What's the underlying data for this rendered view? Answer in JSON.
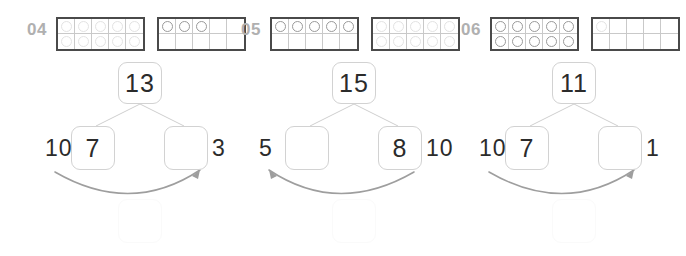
{
  "worksheet": {
    "type": "number-bond-ten-frame-worksheet",
    "problems": [
      {
        "number": "04",
        "frames": [
          {
            "filled": 10,
            "style": "faint"
          },
          {
            "filled": 3,
            "style": "solid"
          }
        ],
        "total": "13",
        "top_value": "13",
        "left_box_value": "7",
        "right_box_value": "",
        "outer_left_label": "10",
        "outer_right_label": "3",
        "arrow_direction": "right",
        "bottom_box_value": ""
      },
      {
        "number": "05",
        "frames": [
          {
            "filled": 5,
            "style": "solid"
          },
          {
            "filled": 10,
            "style": "faint"
          }
        ],
        "total": "15",
        "top_value": "15",
        "left_box_value": "",
        "right_box_value": "8",
        "outer_left_label": "5",
        "outer_right_label": "10",
        "arrow_direction": "left",
        "bottom_box_value": ""
      },
      {
        "number": "06",
        "frames": [
          {
            "filled": 10,
            "style": "solid"
          },
          {
            "filled": 1,
            "style": "faint"
          }
        ],
        "total": "11",
        "top_value": "11",
        "left_box_value": "7",
        "right_box_value": "",
        "outer_left_label": "10",
        "outer_right_label": "1",
        "arrow_direction": "right",
        "bottom_box_value": ""
      }
    ]
  },
  "colors": {
    "problem_number": "#b0b0b0",
    "frame_border": "#4a4a4a",
    "frame_grid": "#c9c9c9",
    "dot_border": "#9a9a9a",
    "dot_border_faint": "#e3e3e3",
    "box_border": "#d2d2d2",
    "ghost_box_border": "#fafafa",
    "digit": "#2b2b2b",
    "arrow": "#9e9e9e",
    "bond_line": "#cfcfcf",
    "background": "#ffffff"
  },
  "icons": {
    "arrow": "curved-arrow-icon",
    "dot": "counter-dot-icon"
  }
}
